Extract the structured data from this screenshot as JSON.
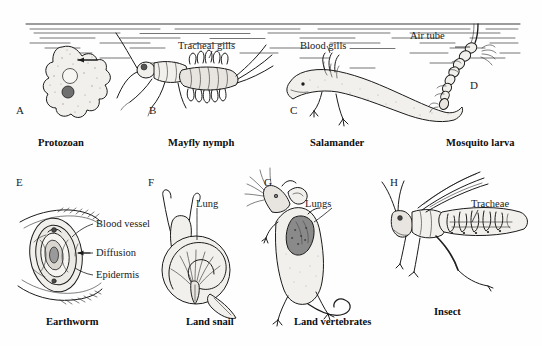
{
  "figure": {
    "background_color": "#fefefe",
    "ink_color": "#1b1b1b"
  },
  "top_row": {
    "environment": "aquatic",
    "water_surface": true,
    "organisms": [
      {
        "letter": "A",
        "caption": "Protozoan",
        "structure_labels": [],
        "mechanism": "diffusion across cell membrane"
      },
      {
        "letter": "B",
        "caption": "Mayfly nymph",
        "structure_labels": [
          "Tracheal gills"
        ],
        "mechanism": "tracheal gills"
      },
      {
        "letter": "C",
        "caption": "Salamander",
        "structure_labels": [
          "Blood gills"
        ],
        "mechanism": "blood gills"
      },
      {
        "letter": "D",
        "caption": "Mosquito larva",
        "structure_labels": [
          "Air tube"
        ],
        "mechanism": "air tube to surface"
      }
    ]
  },
  "bottom_row": {
    "environment": "terrestrial",
    "organisms": [
      {
        "letter": "E",
        "caption": "Earthworm",
        "structure_labels": [
          "Blood vessel",
          "Diffusion",
          "Epidermis"
        ],
        "mechanism": "cutaneous diffusion"
      },
      {
        "letter": "F",
        "caption": "Land snail",
        "structure_labels": [
          "Lung"
        ],
        "mechanism": "mantle lung"
      },
      {
        "letter": "G",
        "caption": "Land vertebrates",
        "structure_labels": [
          "Lungs"
        ],
        "mechanism": "paired lungs"
      },
      {
        "letter": "H",
        "caption": "Insect",
        "structure_labels": [
          "Tracheae"
        ],
        "mechanism": "tracheal system"
      }
    ]
  },
  "labels": {
    "tracheal_gills": "Tracheal gills",
    "blood_gills": "Blood gills",
    "air_tube": "Air tube",
    "blood_vessel": "Blood vessel",
    "diffusion": "Diffusion",
    "epidermis": "Epidermis",
    "lung": "Lung",
    "lungs": "Lungs",
    "tracheae": "Tracheae"
  },
  "letters": {
    "a": "A",
    "b": "B",
    "c": "C",
    "d": "D",
    "e": "E",
    "f": "F",
    "g": "G",
    "h": "H"
  },
  "captions": {
    "protozoan": "Protozoan",
    "mayfly": "Mayfly nymph",
    "salamander": "Salamander",
    "mosquito": "Mosquito larva",
    "earthworm": "Earthworm",
    "land_snail": "Land snail",
    "land_vertebrates": "Land vertebrates",
    "insect": "Insect"
  }
}
